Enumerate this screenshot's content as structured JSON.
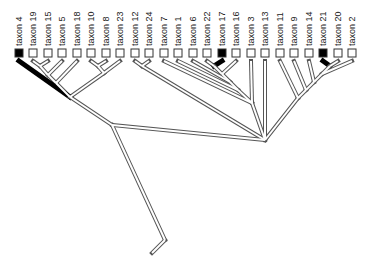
{
  "diagram": {
    "type": "cladogram",
    "taxa": [
      {
        "label": "taxon 4",
        "x": 19,
        "marked": true
      },
      {
        "label": "taxon 19",
        "x": 33,
        "marked": false
      },
      {
        "label": "taxon 15",
        "x": 48,
        "marked": false
      },
      {
        "label": "taxon 5",
        "x": 62,
        "marked": false
      },
      {
        "label": "taxon 18",
        "x": 77,
        "marked": false
      },
      {
        "label": "taxon 10",
        "x": 91,
        "marked": false
      },
      {
        "label": "taxon 8",
        "x": 106,
        "marked": false
      },
      {
        "label": "taxon 23",
        "x": 120,
        "marked": false
      },
      {
        "label": "taxon 12",
        "x": 135,
        "marked": false
      },
      {
        "label": "taxon 24",
        "x": 149,
        "marked": false
      },
      {
        "label": "taxon 7",
        "x": 164,
        "marked": false
      },
      {
        "label": "taxon 1",
        "x": 178,
        "marked": false
      },
      {
        "label": "taxon 6",
        "x": 193,
        "marked": false
      },
      {
        "label": "taxon 22",
        "x": 207,
        "marked": false
      },
      {
        "label": "taxon 17",
        "x": 222,
        "marked": true
      },
      {
        "label": "taxon 16",
        "x": 236,
        "marked": false
      },
      {
        "label": "taxon 3",
        "x": 251,
        "marked": false
      },
      {
        "label": "taxon 13",
        "x": 265,
        "marked": false
      },
      {
        "label": "taxon 11",
        "x": 280,
        "marked": false
      },
      {
        "label": "taxon 9",
        "x": 294,
        "marked": false
      },
      {
        "label": "taxon 14",
        "x": 309,
        "marked": false
      },
      {
        "label": "taxon 21",
        "x": 323,
        "marked": true
      },
      {
        "label": "taxon 20",
        "x": 338,
        "marked": false
      },
      {
        "label": "taxon 2",
        "x": 352,
        "marked": false
      }
    ],
    "nodes": [
      {
        "id": "n19_15",
        "x": 40,
        "y": 66
      },
      {
        "id": "n10_8",
        "x": 98,
        "y": 66
      },
      {
        "id": "n12_24",
        "x": 142,
        "y": 66
      },
      {
        "id": "n22_17",
        "x": 214,
        "y": 66
      },
      {
        "id": "n21_20",
        "x": 330,
        "y": 66
      },
      {
        "id": "nA",
        "x": 48,
        "y": 75
      },
      {
        "id": "nB",
        "x": 56,
        "y": 83
      },
      {
        "id": "nC",
        "x": 104,
        "y": 73
      },
      {
        "id": "nD",
        "x": 70,
        "y": 97
      },
      {
        "id": "nE",
        "x": 112,
        "y": 80
      },
      {
        "id": "nF",
        "x": 222,
        "y": 74
      },
      {
        "id": "nG",
        "x": 230,
        "y": 82
      },
      {
        "id": "nH",
        "x": 238,
        "y": 90
      },
      {
        "id": "nI",
        "x": 322,
        "y": 74
      },
      {
        "id": "nJ",
        "x": 314,
        "y": 82
      },
      {
        "id": "nK",
        "x": 306,
        "y": 90
      },
      {
        "id": "nL",
        "x": 298,
        "y": 98
      },
      {
        "id": "nM",
        "x": 112,
        "y": 125
      },
      {
        "id": "nN",
        "x": 252,
        "y": 103
      },
      {
        "id": "nO",
        "x": 265,
        "y": 140
      },
      {
        "id": "root",
        "x": 165,
        "y": 240
      }
    ],
    "colors": {
      "line": "#555555",
      "fill": "#ffffff",
      "marked": "#000000"
    }
  }
}
